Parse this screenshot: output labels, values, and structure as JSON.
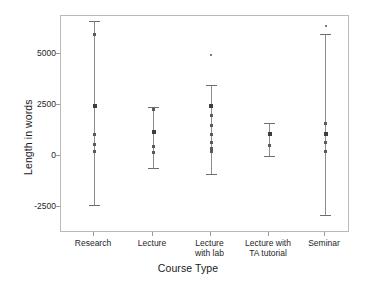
{
  "chart_data": {
    "type": "scatter",
    "title": "",
    "xlabel": "Course Type",
    "ylabel": "Length in words",
    "categories": [
      "Research",
      "Lecture",
      "Lecture\nwith lab",
      "Lecture with\nTA tutorial",
      "Seminar"
    ],
    "ytick_labels": [
      "5000",
      "2500",
      "0",
      "-2500"
    ],
    "ytick_values": [
      5000,
      2500,
      0,
      -2500
    ],
    "ylim": [
      -3400,
      6900
    ],
    "grid": false,
    "legend": "none",
    "series": [
      {
        "name": "Research",
        "mean": 2500,
        "ci_low": -2400,
        "ci_high": 6600,
        "points": [
          6000,
          2500,
          1100,
          600,
          250
        ]
      },
      {
        "name": "Lecture",
        "mean": 1200,
        "ci_low": -600,
        "ci_high": 2400,
        "points": [
          2300,
          1200,
          500,
          200
        ]
      },
      {
        "name": "Lecture with lab",
        "mean": 2500,
        "ci_low": -900,
        "ci_high": 3500,
        "points": [
          5000,
          2500,
          2000,
          1500,
          1100,
          700,
          400,
          250
        ]
      },
      {
        "name": "Lecture with TA tutorial",
        "mean": 1100,
        "ci_low": 0,
        "ci_high": 1600,
        "points": [
          1100,
          550
        ]
      },
      {
        "name": "Seminar",
        "mean": 1100,
        "ci_low": -2900,
        "ci_high": 6000,
        "points": [
          6400,
          1600,
          1100,
          700,
          250
        ]
      }
    ]
  },
  "axes": {
    "ylabel": "Length in words",
    "xlabel": "Course Type"
  }
}
